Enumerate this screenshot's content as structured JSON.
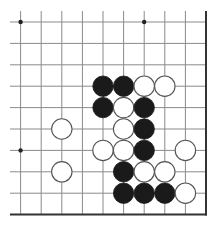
{
  "diagram": {
    "type": "go-board-fragment",
    "columns": 10,
    "rows": 10,
    "open_edges": [
      "top",
      "left"
    ],
    "board_edges": [
      "right",
      "bottom"
    ],
    "colors": {
      "background": "#ffffff",
      "grid_line": "#8a8a8a",
      "edge_line": "#333333",
      "star_point": "#222222",
      "black_stone": "#1a1a1a",
      "white_stone": "#ffffff",
      "stone_outline": "#555555"
    },
    "star_points": [
      {
        "col": 0,
        "row": 0
      },
      {
        "col": 6,
        "row": 0
      },
      {
        "col": 0,
        "row": 6
      }
    ],
    "stones": [
      {
        "col": 4,
        "row": 3,
        "color": "black"
      },
      {
        "col": 5,
        "row": 3,
        "color": "black"
      },
      {
        "col": 6,
        "row": 3,
        "color": "white"
      },
      {
        "col": 7,
        "row": 3,
        "color": "white"
      },
      {
        "col": 4,
        "row": 4,
        "color": "black"
      },
      {
        "col": 5,
        "row": 4,
        "color": "white"
      },
      {
        "col": 6,
        "row": 4,
        "color": "black"
      },
      {
        "col": 2,
        "row": 5,
        "color": "white"
      },
      {
        "col": 5,
        "row": 5,
        "color": "white"
      },
      {
        "col": 6,
        "row": 5,
        "color": "black"
      },
      {
        "col": 4,
        "row": 6,
        "color": "white"
      },
      {
        "col": 5,
        "row": 6,
        "color": "white"
      },
      {
        "col": 6,
        "row": 6,
        "color": "black"
      },
      {
        "col": 8,
        "row": 6,
        "color": "white"
      },
      {
        "col": 2,
        "row": 7,
        "color": "white"
      },
      {
        "col": 5,
        "row": 7,
        "color": "black"
      },
      {
        "col": 6,
        "row": 7,
        "color": "white"
      },
      {
        "col": 7,
        "row": 7,
        "color": "white"
      },
      {
        "col": 5,
        "row": 8,
        "color": "black"
      },
      {
        "col": 6,
        "row": 8,
        "color": "black"
      },
      {
        "col": 7,
        "row": 8,
        "color": "black"
      },
      {
        "col": 8,
        "row": 8,
        "color": "white"
      }
    ]
  }
}
